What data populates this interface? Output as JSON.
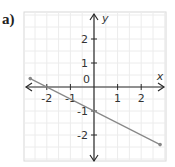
{
  "label": "a)",
  "colors": {
    "axis": "#2a2a2a",
    "line": "#888888",
    "grid": "#ececec",
    "border": "#d8d8d8"
  },
  "chart_data": {
    "type": "line",
    "title": "",
    "panel_label": "a)",
    "xlabel": "x",
    "ylabel": "y",
    "xlim": [
      -2.9,
      3.0
    ],
    "ylim": [
      -3.1,
      3.1
    ],
    "x_ticks": [
      -2,
      -1,
      1,
      2
    ],
    "x_tick_labels": [
      "-2",
      "-1",
      "1",
      "2"
    ],
    "y_ticks": [
      2,
      1,
      -1,
      -2
    ],
    "y_tick_labels": [
      "2",
      "1",
      "-1",
      "-2"
    ],
    "origin_label": "0",
    "grid": true,
    "grid_step": 0.5,
    "series": [
      {
        "name": "y = -0.5x - 1",
        "equation": "y = -0.5x - 1",
        "slope": -0.5,
        "y_intercept": -1,
        "x_intercept": -2,
        "x": [
          -2.7,
          2.8
        ],
        "y": [
          0.35,
          -2.4
        ],
        "endpoints_marked": true
      }
    ]
  }
}
